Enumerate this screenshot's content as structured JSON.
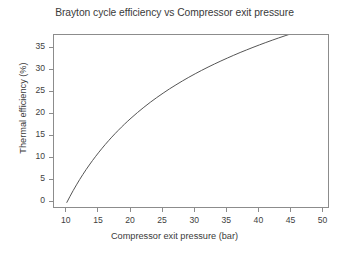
{
  "chart_data": {
    "type": "line",
    "title": "Brayton cycle efficiency vs Compressor exit pressure",
    "xlabel": "Compressor exit pressure (bar)",
    "ylabel": "Thermal efficiency (%)",
    "xlim": [
      8.0,
      51.0
    ],
    "ylim": [
      -1.5,
      38.0
    ],
    "xticks": [
      10,
      15,
      20,
      25,
      30,
      35,
      40,
      45,
      50
    ],
    "xtick_labels": [
      "10",
      "15",
      "20",
      "25",
      "30",
      "35",
      "40",
      "45",
      "50"
    ],
    "yticks": [
      0,
      5,
      10,
      15,
      20,
      25,
      30,
      35
    ],
    "ytick_labels": [
      "0",
      "5",
      "10",
      "15",
      "20",
      "25",
      "30",
      "35"
    ],
    "grid": false,
    "legend": false,
    "line_color": "#555555",
    "line_width": 1.0,
    "frame_color": "#8c8c8c",
    "background": "#ffffff",
    "series": [
      {
        "name": "Thermal efficiency",
        "x": [
          10.0,
          10.5,
          11.0,
          11.5,
          12.0,
          12.5,
          13.0,
          13.5,
          14.0,
          14.5,
          15.0,
          16.0,
          17.0,
          18.0,
          19.0,
          20.0,
          21.0,
          22.0,
          23.0,
          24.0,
          25.0,
          26.0,
          27.0,
          28.0,
          29.0,
          30.0,
          31.0,
          32.0,
          33.0,
          34.0,
          35.0,
          36.0,
          37.0,
          38.0,
          39.0,
          40.0,
          41.0,
          42.0,
          43.0,
          44.0,
          45.0,
          46.0,
          47.0,
          48.0,
          49.0
        ],
        "y": [
          0.0,
          1.38,
          2.7,
          3.95,
          5.14,
          6.28,
          7.37,
          8.41,
          9.42,
          10.38,
          11.31,
          13.06,
          14.69,
          16.21,
          17.63,
          18.96,
          20.22,
          21.4,
          22.52,
          23.59,
          24.6,
          25.56,
          26.48,
          27.36,
          28.2,
          29.01,
          29.79,
          30.53,
          31.25,
          31.95,
          32.62,
          33.26,
          33.89,
          34.49,
          35.08,
          35.65,
          36.2,
          36.74,
          37.26,
          37.76,
          38.25,
          38.73,
          39.2,
          39.65,
          40.09
        ]
      }
    ],
    "displayed_series": [
      {
        "name": "Thermal efficiency",
        "x": [
          10.0,
          10.4,
          10.8,
          11.2,
          11.6,
          12.0,
          12.5,
          13.0,
          13.5,
          14.0,
          14.5,
          15.0,
          15.5,
          16.0,
          16.5,
          17.0,
          17.5,
          18.0,
          18.5,
          19.0,
          19.5,
          20.0,
          21.0,
          22.0,
          23.0,
          24.0,
          25.0,
          26.0,
          27.0,
          28.0,
          29.0,
          30.0,
          31.0,
          32.0,
          33.0,
          34.0,
          35.0,
          36.0,
          37.0,
          38.0,
          39.0,
          40.0,
          41.0,
          42.0,
          43.0,
          44.0,
          45.0,
          46.0,
          47.0,
          48.0,
          49.0
        ],
        "y": [
          0.0,
          1.12,
          2.2,
          3.24,
          4.25,
          5.22,
          6.38,
          7.49,
          8.55,
          9.57,
          10.55,
          11.49,
          12.4,
          13.27,
          14.12,
          14.93,
          15.72,
          16.48,
          17.22,
          17.93,
          18.62,
          19.29,
          20.56,
          21.76,
          22.89,
          23.95,
          24.96,
          25.91,
          26.81,
          27.67,
          28.49,
          29.28,
          30.03,
          30.75,
          31.44,
          32.11,
          32.75,
          33.37,
          33.96,
          34.54,
          35.09,
          35.63,
          36.15,
          36.65,
          37.14,
          37.61,
          38.07,
          38.52,
          38.95,
          39.38,
          39.79
        ]
      }
    ],
    "curve_endpoints": {
      "start": {
        "x": 10.0,
        "y": 0.0
      },
      "end": {
        "x": 49.0,
        "y": 36.5
      }
    },
    "curve_samples": {
      "x": [
        10.0,
        10.5,
        11.0,
        11.5,
        12.0,
        12.5,
        13.0,
        13.5,
        14.0,
        14.5,
        15.0,
        15.5,
        16.0,
        16.5,
        17.0,
        17.5,
        18.0,
        18.5,
        19.0,
        19.5,
        20.0,
        21.0,
        22.0,
        23.0,
        24.0,
        25.0,
        26.0,
        27.0,
        28.0,
        29.0,
        30.0,
        31.0,
        32.0,
        33.0,
        34.0,
        35.0,
        36.0,
        37.0,
        38.0,
        39.0,
        40.0,
        41.0,
        42.0,
        43.0,
        44.0,
        45.0,
        46.0,
        47.0,
        48.0,
        49.0
      ],
      "y": [
        0.0,
        1.39,
        2.72,
        3.98,
        5.19,
        6.34,
        7.44,
        8.49,
        9.5,
        10.47,
        11.4,
        12.3,
        13.17,
        14.0,
        14.81,
        15.59,
        16.34,
        17.07,
        17.78,
        18.46,
        19.12,
        20.39,
        21.59,
        22.72,
        23.79,
        24.8,
        25.77,
        26.68,
        27.56,
        28.4,
        29.2,
        29.97,
        30.71,
        31.42,
        32.1,
        32.76,
        33.4,
        34.02,
        34.61,
        35.19,
        35.75,
        36.29,
        36.82,
        37.33,
        37.83,
        38.31,
        38.78,
        39.24,
        39.69,
        40.12
      ]
    }
  }
}
